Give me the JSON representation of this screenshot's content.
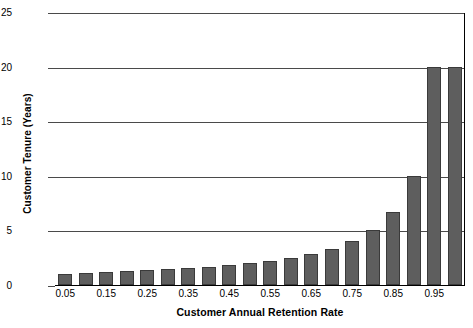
{
  "chart_data": {
    "type": "bar",
    "title": "",
    "xlabel": "Customer Annual Retention Rate",
    "ylabel": "Customer Tenure (Years)",
    "categories": [
      "0.05",
      "0.10",
      "0.15",
      "0.20",
      "0.25",
      "0.30",
      "0.35",
      "0.40",
      "0.45",
      "0.50",
      "0.55",
      "0.60",
      "0.65",
      "0.70",
      "0.75",
      "0.80",
      "0.85",
      "0.90",
      "0.95",
      "1.00"
    ],
    "values": [
      1.05,
      1.11,
      1.18,
      1.25,
      1.33,
      1.43,
      1.54,
      1.67,
      1.82,
      2.0,
      2.22,
      2.5,
      2.86,
      3.33,
      4.0,
      5.0,
      6.67,
      10.0,
      20.0,
      20.0
    ],
    "ylim": [
      0,
      25
    ],
    "yticks": [
      "0",
      "5",
      "10",
      "15",
      "20",
      "25"
    ],
    "ytick_values": [
      0,
      5,
      10,
      15,
      20,
      25
    ],
    "xtick_labels": [
      "0.05",
      "0.15",
      "0.25",
      "0.35",
      "0.45",
      "0.55",
      "0.65",
      "0.75",
      "0.85",
      "0.95"
    ],
    "xtick_indices": [
      0,
      2,
      4,
      6,
      8,
      10,
      12,
      14,
      16,
      18
    ],
    "grid": true,
    "legend": "none",
    "bar_color": "#5e5e5e",
    "bar_border_color": "#3a3a3a",
    "gridline_color": "#4a4a4a",
    "axis_color": "#000000",
    "background": "#ffffff"
  }
}
